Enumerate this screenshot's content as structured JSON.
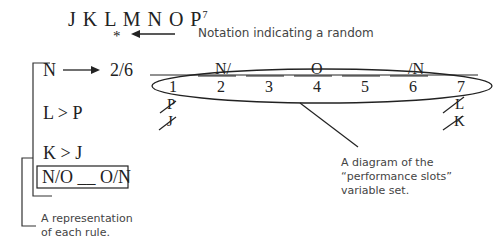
{
  "variables": {
    "letters": "J K L M N O P",
    "count": "7",
    "random_marker": "*"
  },
  "annotations": {
    "random_note": "Notation indicating a random",
    "rules_note_line1": "A representation",
    "rules_note_line2": "of each rule.",
    "slots_note_line1": "A diagram of the",
    "slots_note_line2": "“performance slots”",
    "slots_note_line3": "variable set."
  },
  "rules": [
    {
      "left": "N",
      "right": "2/6"
    },
    {
      "text": "L > P"
    },
    {
      "text": "K > J"
    },
    {
      "text": "N/O __ O/N"
    }
  ],
  "slots": {
    "numbers": [
      "1",
      "2",
      "3",
      "4",
      "5",
      "6",
      "7"
    ],
    "above": {
      "2": "N/",
      "4": "O",
      "6": "/N"
    },
    "below_1": [
      "P",
      "J"
    ],
    "below_7": [
      "L",
      "K"
    ]
  },
  "colors": {
    "ink": "#222222",
    "note": "#444444"
  }
}
